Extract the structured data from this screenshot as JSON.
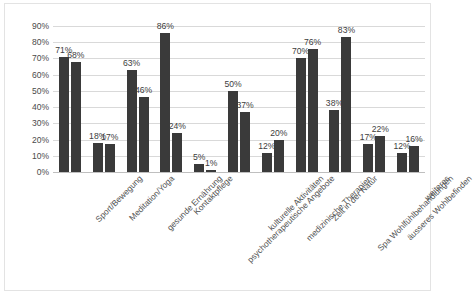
{
  "chart_data": {
    "type": "bar",
    "title": "",
    "subtitle": "",
    "xlabel": "",
    "ylabel": "",
    "ylim": [
      0,
      90
    ],
    "ytick_labels": [
      "90%",
      "80%",
      "70%",
      "60%",
      "50%",
      "40%",
      "30%",
      "20%",
      "10%",
      "0%"
    ],
    "ytick_values": [
      90,
      80,
      70,
      60,
      50,
      40,
      30,
      20,
      10,
      0
    ],
    "grid": true,
    "legend": "none",
    "value_labels": true,
    "value_label_suffix": "%",
    "bar_color": "#3a3a3a",
    "grid_color": "#d9d9d9",
    "categories": [
      "Sport/Bewegung",
      "Meditation/Yoga",
      "gesunde Ernährung",
      "Kontaktpflege",
      "psychotherapeutische Angebote",
      "kulturelle Aktivitäten",
      "medizinische Therapien",
      "Zeit in der Natur",
      "Spa Wohlfühlbehandlungen",
      "äusseres Wohlbefinden",
      "weiteres"
    ],
    "series": [
      {
        "name": "Reihe 1",
        "values": [
          71,
          18,
          63,
          86,
          5,
          50,
          12,
          70,
          38,
          17,
          12
        ],
        "labels": [
          "71%",
          "18%",
          "63%",
          "86%",
          "5%",
          "50%",
          "12%",
          "70%",
          "38%",
          "17%",
          "12%"
        ]
      },
      {
        "name": "Reihe 2",
        "values": [
          68,
          17,
          46,
          24,
          1,
          37,
          20,
          76,
          83,
          22,
          16
        ],
        "labels": [
          "68%",
          "17%",
          "46%",
          "24%",
          "1%",
          "37%",
          "20%",
          "76%",
          "83%",
          "22%",
          "16%"
        ]
      }
    ]
  }
}
